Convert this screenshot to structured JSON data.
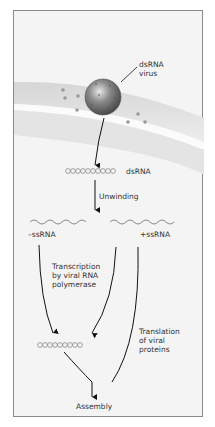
{
  "figure": {
    "virus_label": [
      "dsRNA",
      "virus"
    ],
    "dsrna_label": "dsRNA",
    "unwinding_label": "Unwinding",
    "minus_label": "–ssRNA",
    "plus_label": "+ssRNA",
    "transcription_label": [
      "Transcription",
      "by viral RNA",
      "polymerase"
    ],
    "translation_label": [
      "Translation",
      "of viral",
      "proteins"
    ],
    "assembly_label": "Assembly"
  },
  "colors": {
    "frame_border": "#8a8a8a",
    "background": "#f4f4f4",
    "membrane": "#dedede",
    "virus": "#7a7a7a",
    "arrow": "#111111",
    "rna": "#8c8c8c",
    "text": "#333333"
  }
}
